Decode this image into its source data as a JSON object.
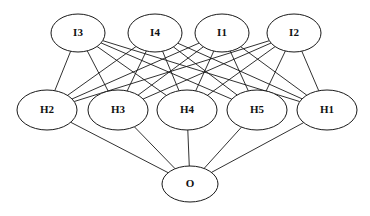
{
  "diagram": {
    "type": "feedforward-neural-network",
    "background_color": "#ffffff",
    "node_fill_color": "#ffffff",
    "node_stroke_color": "#1a1a1a",
    "edge_color": "#1a1a1a"
  },
  "layers": [
    {
      "name": "input-layer",
      "role": "input",
      "nodes": [
        {
          "id": "I3",
          "label": "I3",
          "cx": 78,
          "cy": 33,
          "rx": 27,
          "ry": 19
        },
        {
          "id": "I4",
          "label": "I4",
          "cx": 155,
          "cy": 33,
          "rx": 27,
          "ry": 19
        },
        {
          "id": "I1",
          "label": "I1",
          "cx": 222,
          "cy": 33,
          "rx": 27,
          "ry": 19
        },
        {
          "id": "I2",
          "label": "I2",
          "cx": 294,
          "cy": 33,
          "rx": 27,
          "ry": 19
        }
      ]
    },
    {
      "name": "hidden-layer",
      "role": "hidden",
      "nodes": [
        {
          "id": "H2",
          "label": "H2",
          "cx": 47,
          "cy": 110,
          "rx": 30,
          "ry": 20
        },
        {
          "id": "H3",
          "label": "H3",
          "cx": 118,
          "cy": 110,
          "rx": 30,
          "ry": 20
        },
        {
          "id": "H4",
          "label": "H4",
          "cx": 187,
          "cy": 110,
          "rx": 30,
          "ry": 20
        },
        {
          "id": "H5",
          "label": "H5",
          "cx": 257,
          "cy": 110,
          "rx": 30,
          "ry": 20
        },
        {
          "id": "H1",
          "label": "H1",
          "cx": 327,
          "cy": 110,
          "rx": 30,
          "ry": 20
        }
      ]
    },
    {
      "name": "output-layer",
      "role": "output",
      "nodes": [
        {
          "id": "O",
          "label": "O",
          "cx": 190,
          "cy": 184,
          "rx": 28,
          "ry": 18
        }
      ]
    }
  ],
  "edges": [
    {
      "from": "I3",
      "to": "H2"
    },
    {
      "from": "I3",
      "to": "H3"
    },
    {
      "from": "I3",
      "to": "H4"
    },
    {
      "from": "I3",
      "to": "H5"
    },
    {
      "from": "I3",
      "to": "H1"
    },
    {
      "from": "I4",
      "to": "H2"
    },
    {
      "from": "I4",
      "to": "H3"
    },
    {
      "from": "I4",
      "to": "H4"
    },
    {
      "from": "I4",
      "to": "H5"
    },
    {
      "from": "I4",
      "to": "H1"
    },
    {
      "from": "I1",
      "to": "H2"
    },
    {
      "from": "I1",
      "to": "H3"
    },
    {
      "from": "I1",
      "to": "H4"
    },
    {
      "from": "I1",
      "to": "H5"
    },
    {
      "from": "I1",
      "to": "H1"
    },
    {
      "from": "I2",
      "to": "H2"
    },
    {
      "from": "I2",
      "to": "H3"
    },
    {
      "from": "I2",
      "to": "H4"
    },
    {
      "from": "I2",
      "to": "H5"
    },
    {
      "from": "I2",
      "to": "H1"
    },
    {
      "from": "H2",
      "to": "O"
    },
    {
      "from": "H3",
      "to": "O"
    },
    {
      "from": "H4",
      "to": "O"
    },
    {
      "from": "H5",
      "to": "O"
    },
    {
      "from": "H1",
      "to": "O"
    }
  ]
}
